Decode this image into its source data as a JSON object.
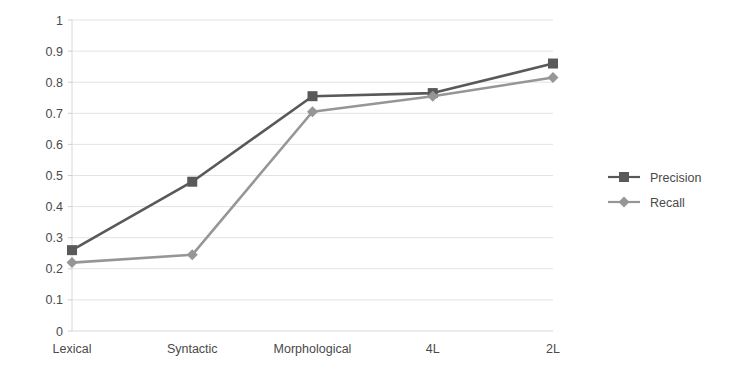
{
  "chart_data": {
    "type": "line",
    "title": "",
    "xlabel": "",
    "ylabel": "",
    "categories": [
      "Lexical",
      "Syntactic",
      "Morphological",
      "4L",
      "2L"
    ],
    "ylim": [
      0,
      1
    ],
    "ytick_step": 0.1,
    "yticks": [
      "1",
      "0.9",
      "0.8",
      "0.7",
      "0.6",
      "0.5",
      "0.4",
      "0.3",
      "0.2",
      "0.1",
      "0"
    ],
    "grid": true,
    "legend_position": "right",
    "series": [
      {
        "name": "Precision",
        "values": [
          0.26,
          0.48,
          0.755,
          0.765,
          0.86
        ],
        "color": "#595959",
        "marker": "square"
      },
      {
        "name": "Recall",
        "values": [
          0.22,
          0.245,
          0.705,
          0.755,
          0.815
        ],
        "color": "#969696",
        "marker": "diamond"
      }
    ]
  },
  "legend": {
    "items": [
      {
        "label": "Precision"
      },
      {
        "label": "Recall"
      }
    ]
  },
  "axis": {
    "y_max_label": "1",
    "y_min_label": "0"
  }
}
